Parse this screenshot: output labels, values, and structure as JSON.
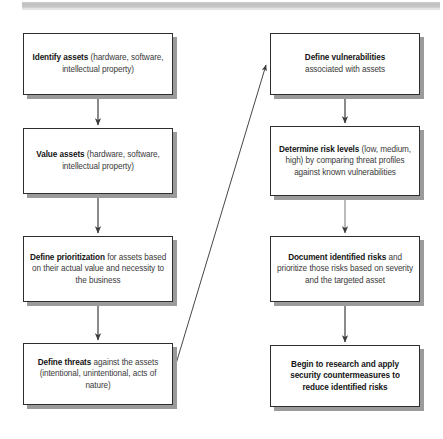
{
  "diagram": {
    "style": {
      "box_border_color": "#2e2e2e",
      "box_fill_color": "#ffffff",
      "box_shadow_color": "#9b9b9b",
      "text_color": "#3a3a3a",
      "bold_text_color": "#141414",
      "connector_color": "#3c3c3c",
      "page_band_color": "#c4c4c4"
    },
    "nodes": [
      {
        "id": "identify-assets",
        "column": "left",
        "row": 1,
        "bold": "Identify assets",
        "rest": " (hardware, software, intellectual property)"
      },
      {
        "id": "value-assets",
        "column": "left",
        "row": 2,
        "bold": "Value assets",
        "rest": " (hardware, software, intellectual property)"
      },
      {
        "id": "define-prioritization",
        "column": "left",
        "row": 3,
        "bold": "Define prioritization",
        "rest": " for assets based on their actual value and necessity to the business"
      },
      {
        "id": "define-threats",
        "column": "left",
        "row": 4,
        "bold": "Define threats",
        "rest": " against the assets (intentional, unintentional, acts of nature)"
      },
      {
        "id": "define-vulnerabilities",
        "column": "right",
        "row": 1,
        "bold": "Define vulnerabilities",
        "rest": " associated with assets"
      },
      {
        "id": "determine-risk-levels",
        "column": "right",
        "row": 2,
        "bold": "Determine risk levels",
        "rest": " (low, medium, high) by comparing threat profiles against known vulnerabilities"
      },
      {
        "id": "document-identified-risks",
        "column": "right",
        "row": 3,
        "bold": "Document identified risks",
        "rest": " and prioritize those risks based on severity and the targeted asset"
      },
      {
        "id": "begin-countermeasures",
        "column": "right",
        "row": 4,
        "bold": "Begin to research and apply security countermeasures to reduce identified risks",
        "rest": ""
      }
    ],
    "edges": [
      {
        "id": "edge-identify-to-value",
        "from": "identify-assets",
        "to": "value-assets",
        "kind": "vertical-arrow"
      },
      {
        "id": "edge-value-to-prioritization",
        "from": "value-assets",
        "to": "define-prioritization",
        "kind": "vertical-arrow"
      },
      {
        "id": "edge-prioritization-to-threats",
        "from": "define-prioritization",
        "to": "define-threats",
        "kind": "vertical-arrow"
      },
      {
        "id": "edge-threats-to-vulnerabilities",
        "from": "define-threats",
        "to": "define-vulnerabilities",
        "kind": "diagonal-arrow"
      },
      {
        "id": "edge-vulnerabilities-to-risklevels",
        "from": "define-vulnerabilities",
        "to": "determine-risk-levels",
        "kind": "vertical-arrow"
      },
      {
        "id": "edge-risklevels-to-document",
        "from": "determine-risk-levels",
        "to": "document-identified-risks",
        "kind": "vertical-arrow"
      },
      {
        "id": "edge-document-to-countermeasures",
        "from": "document-identified-risks",
        "to": "begin-countermeasures",
        "kind": "vertical-arrow"
      }
    ]
  }
}
